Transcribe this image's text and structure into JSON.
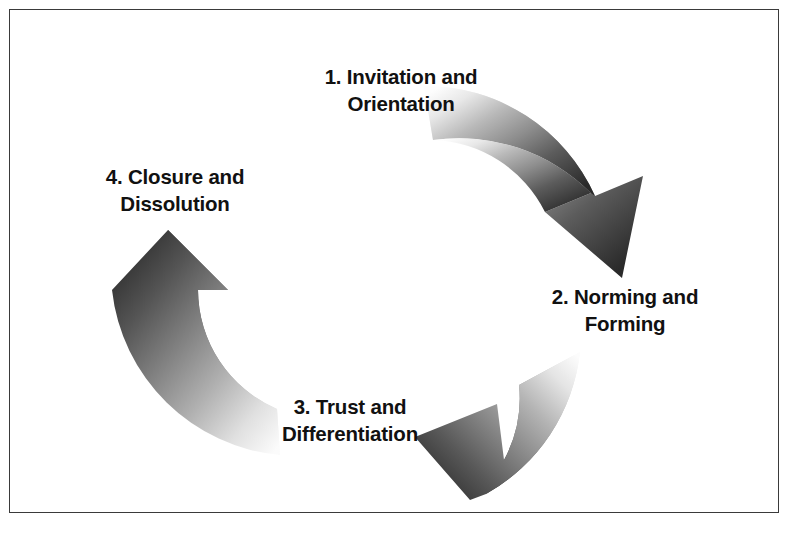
{
  "diagram": {
    "type": "cyclical-process",
    "direction": "clockwise",
    "border_color": "#3a3a3a",
    "background_color": "#ffffff",
    "arrow_dark_color": "#2d2d2d",
    "arrow_mid_color": "#8a8a8a",
    "arrow_light_color": "#f2f2f2",
    "stages": [
      {
        "id": "stage-1",
        "number": "1.",
        "text": "1. Invitation and\nOrientation"
      },
      {
        "id": "stage-2",
        "number": "2.",
        "text": "2. Norming and\nForming"
      },
      {
        "id": "stage-3",
        "number": "3.",
        "text": "3. Trust and\nDifferentiation"
      },
      {
        "id": "stage-4",
        "number": "4.",
        "text": "4. Closure and\nDissolution"
      }
    ],
    "arrows": [
      {
        "id": "arrow-top-right",
        "from_stage": "stage-1",
        "to_stage": "stage-2",
        "points": "down-right"
      },
      {
        "id": "arrow-bottom",
        "from_stage": "stage-2",
        "to_stage": "stage-3",
        "points": "left"
      },
      {
        "id": "arrow-left",
        "from_stage": "stage-3",
        "to_stage": "stage-4",
        "points": "up"
      }
    ]
  }
}
